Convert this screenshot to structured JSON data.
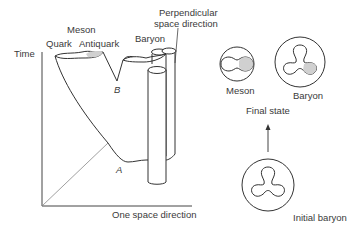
{
  "diagram": {
    "axes": {
      "time_label": "Time",
      "space_label": "One space direction",
      "perpendicular_label_line1": "Perpendicular",
      "perpendicular_label_line2": "space direction"
    },
    "worldsheet": {
      "meson_label": "Meson",
      "quark_label": "Quark",
      "antiquark_label": "Antiquark",
      "baryon_label": "Baryon",
      "point_a": "A",
      "point_b": "B"
    },
    "states": {
      "final_meson_label": "Meson",
      "final_baryon_label": "Baryon",
      "final_state_label": "Final state",
      "initial_baryon_label": "Initial baryon"
    },
    "colors": {
      "line": "#333333",
      "shade": "#d0d0d0",
      "axis_diag": "#888888"
    }
  }
}
